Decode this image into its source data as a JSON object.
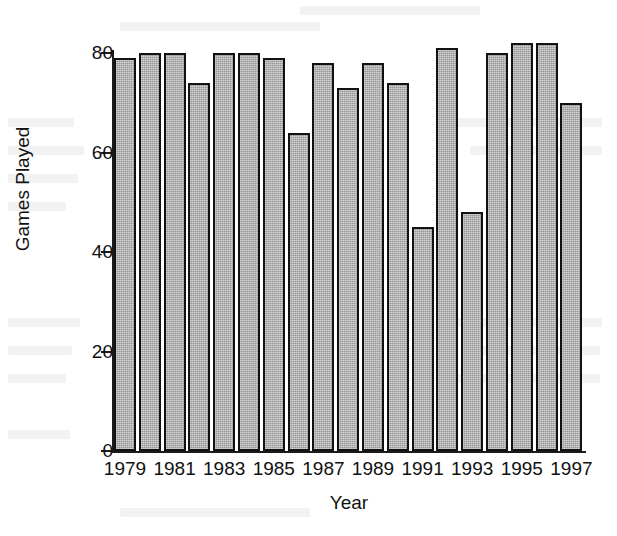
{
  "chart_data": {
    "type": "bar",
    "title": "",
    "subtitle": "",
    "xlabel": "Year",
    "ylabel": "Games Played",
    "categories": [
      "1979",
      "1980",
      "1981",
      "1982",
      "1983",
      "1984",
      "1985",
      "1986",
      "1987",
      "1988",
      "1989",
      "1990",
      "1991",
      "1992",
      "1993",
      "1994",
      "1995",
      "1996",
      "1997"
    ],
    "values": [
      79,
      80,
      80,
      74,
      80,
      80,
      79,
      64,
      78,
      73,
      78,
      74,
      45,
      81,
      48,
      80,
      82,
      82,
      70
    ],
    "series": [
      {
        "name": "Games Played",
        "values": [
          79,
          80,
          80,
          74,
          80,
          80,
          79,
          64,
          78,
          73,
          78,
          74,
          45,
          81,
          48,
          80,
          82,
          82,
          70
        ]
      }
    ],
    "ylim": [
      0,
      84
    ],
    "xlim_note": "19 categorical bars, one per year",
    "y_ticks": [
      0,
      20,
      40,
      60,
      80
    ],
    "y_tick_labels": [
      "0",
      "20",
      "40",
      "60",
      "80"
    ],
    "x_tick_labels": [
      "1979",
      "1981",
      "1983",
      "1985",
      "1987",
      "1989",
      "1991",
      "1993",
      "1995",
      "1997"
    ],
    "x_tick_categories": [
      "1979",
      "1981",
      "1983",
      "1985",
      "1987",
      "1989",
      "1991",
      "1993",
      "1995",
      "1997"
    ],
    "grid": false,
    "legend": false,
    "legend_position": "none",
    "annotations": [],
    "colors": {
      "bar_fill": "#a9a9a9",
      "bar_edge": "#111111",
      "axis": "#1a1a1a",
      "text": "#111111",
      "background": "#ffffff"
    }
  }
}
